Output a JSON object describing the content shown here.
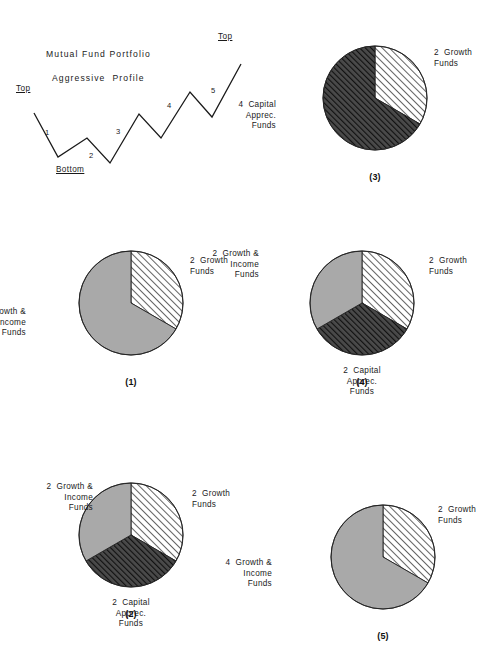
{
  "page": {
    "width": 501,
    "height": 663,
    "background": "#ffffff",
    "ink": "#1a1a1a"
  },
  "wave_chart": {
    "title_line1": "Mutual Fund Portfolio",
    "title_line2": "Aggressive  Profile",
    "markers": [
      {
        "label": "Top",
        "x": 16,
        "y": 84
      },
      {
        "label": "Top",
        "x": 218,
        "y": 32
      },
      {
        "label": "Bottom",
        "x": 56,
        "y": 165
      }
    ],
    "wave_numbers": [
      {
        "label": "1",
        "x": 45,
        "y": 128
      },
      {
        "label": "2",
        "x": 89,
        "y": 151
      },
      {
        "label": "3",
        "x": 116,
        "y": 127
      },
      {
        "label": "4",
        "x": 167,
        "y": 101
      },
      {
        "label": "5",
        "x": 211,
        "y": 86
      }
    ],
    "points": "34,113 58,157 87,138 110,163 139,114 161,138 190,92 212,117 241,64",
    "stroke": "#1a1a1a",
    "stroke_width": 1.3
  },
  "chart_data": [
    {
      "id": "chart-3",
      "type": "pie",
      "caption": "(3)",
      "center": {
        "cx": 375,
        "cy": 98
      },
      "radius": 52,
      "slices": [
        {
          "name": "2 Growth Funds",
          "label": "2  Growth\nFunds",
          "value": 2,
          "share_deg": 120,
          "start_deg": 0,
          "fill": "light-hatch",
          "label_pos": {
            "x": 434,
            "y": 48
          },
          "align": "left"
        },
        {
          "name": "4 Capital Apprec. Funds",
          "label": "4  Capital\nApprec.\nFunds",
          "value": 4,
          "share_deg": 240,
          "start_deg": 120,
          "fill": "dark-hatch",
          "label_pos": {
            "x": 276,
            "y": 100
          },
          "align": "right"
        }
      ]
    },
    {
      "id": "chart-1",
      "type": "pie",
      "caption": "(1)",
      "center": {
        "cx": 131,
        "cy": 303
      },
      "radius": 52,
      "slices": [
        {
          "name": "2 Growth Funds",
          "label": "2  Growth\nFunds",
          "value": 2,
          "share_deg": 120,
          "start_deg": 0,
          "fill": "light-hatch",
          "label_pos": {
            "x": 190,
            "y": 256
          },
          "align": "left"
        },
        {
          "name": "4 Growth & Income Funds",
          "label": "4  Growth &\nIncome\nFunds",
          "value": 4,
          "share_deg": 240,
          "start_deg": 120,
          "fill": "gray",
          "label_pos": {
            "x": 26,
            "y": 307
          },
          "align": "right"
        }
      ]
    },
    {
      "id": "chart-4",
      "type": "pie",
      "caption": "(4)",
      "center": {
        "cx": 362,
        "cy": 303
      },
      "radius": 52,
      "slices": [
        {
          "name": "2 Growth Funds",
          "label": "2  Growth\nFunds",
          "value": 2,
          "share_deg": 120,
          "start_deg": 0,
          "fill": "light-hatch",
          "label_pos": {
            "x": 429,
            "y": 256
          },
          "align": "left"
        },
        {
          "name": "2 Capital Apprec. Funds",
          "label": "2  Capital\nApprec.\nFunds",
          "value": 2,
          "share_deg": 120,
          "start_deg": 120,
          "fill": "dark-hatch",
          "label_pos": {
            "x": 362,
            "y": 366
          },
          "align": "center"
        },
        {
          "name": "2 Growth & Income Funds",
          "label": "2  Growth &\nIncome\nFunds",
          "value": 2,
          "share_deg": 120,
          "start_deg": 240,
          "fill": "gray",
          "label_pos": {
            "x": 259,
            "y": 249
          },
          "align": "right"
        }
      ]
    },
    {
      "id": "chart-2",
      "type": "pie",
      "caption": "(2)",
      "center": {
        "cx": 131,
        "cy": 535
      },
      "radius": 52,
      "slices": [
        {
          "name": "2 Growth Funds",
          "label": "2  Growth\nFunds",
          "value": 2,
          "share_deg": 120,
          "start_deg": 0,
          "fill": "light-hatch",
          "label_pos": {
            "x": 192,
            "y": 489
          },
          "align": "left"
        },
        {
          "name": "2 Capital Apprec. Funds",
          "label": "2  Capital\nApprec.\nFunds",
          "value": 2,
          "share_deg": 120,
          "start_deg": 120,
          "fill": "dark-hatch",
          "label_pos": {
            "x": 131,
            "y": 598
          },
          "align": "center"
        },
        {
          "name": "2 Growth & Income Funds",
          "label": "2  Growth &\nIncome\nFunds",
          "value": 2,
          "share_deg": 120,
          "start_deg": 240,
          "fill": "gray",
          "label_pos": {
            "x": 93,
            "y": 482
          },
          "align": "right"
        }
      ]
    },
    {
      "id": "chart-5",
      "type": "pie",
      "caption": "(5)",
      "center": {
        "cx": 383,
        "cy": 557
      },
      "radius": 52,
      "slices": [
        {
          "name": "2 Growth Funds",
          "label": "2  Growth\nFunds",
          "value": 2,
          "share_deg": 120,
          "start_deg": 0,
          "fill": "light-hatch",
          "label_pos": {
            "x": 438,
            "y": 505
          },
          "align": "left"
        },
        {
          "name": "4 Growth & Income Funds",
          "label": "4  Growth &\nIncome\nFunds",
          "value": 4,
          "share_deg": 240,
          "start_deg": 120,
          "fill": "gray",
          "label_pos": {
            "x": 272,
            "y": 558
          },
          "align": "right"
        }
      ]
    }
  ],
  "captions": {
    "c3": "(3)",
    "c1": "(1)",
    "c4": "(4)",
    "c2": "(2)",
    "c5": "(5)"
  },
  "colors": {
    "ink": "#1a1a1a",
    "gray_fill": "#a9a9a9",
    "dark_hatch_bg": "#4a4a4a",
    "dark_hatch_line": "#111111",
    "light_hatch_bg": "#ffffff",
    "light_hatch_line": "#303030",
    "outline": "#222222"
  }
}
